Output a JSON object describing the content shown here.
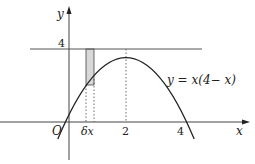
{
  "figure": {
    "function_label": "y = x(4− x)",
    "axis_x_label": "x",
    "axis_y_label": "y",
    "origin_label": "O",
    "y_tick_label": "4",
    "x_tick_labels": [
      "δx",
      "2",
      "4"
    ],
    "colors": {
      "line": "#222222",
      "strip": "#d8d8d8"
    }
  }
}
